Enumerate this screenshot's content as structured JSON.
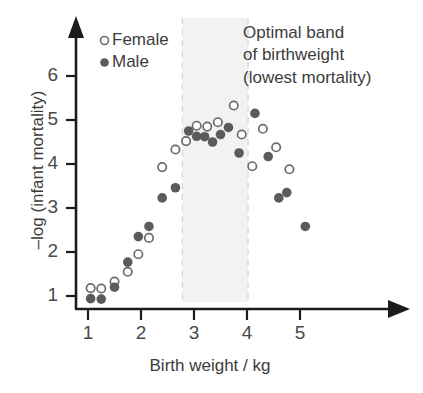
{
  "chart_data": {
    "type": "scatter",
    "title": "",
    "xlabel": "Birth weight / kg",
    "ylabel": "–log (infant mortality)",
    "xlim": [
      0.75,
      5.85
    ],
    "ylim": [
      0.55,
      6.6
    ],
    "xticks": [
      1,
      2,
      3,
      4,
      5
    ],
    "yticks": [
      1,
      2,
      3,
      4,
      5,
      6
    ],
    "xtick_labels": [
      "1",
      "2",
      "3",
      "4",
      "5"
    ],
    "ytick_labels": [
      "1",
      "2",
      "3",
      "4",
      "5",
      "6"
    ],
    "grid": false,
    "legend_position": "upper-left",
    "series": [
      {
        "name": "Female",
        "marker": "open-circle",
        "color": "#ffffff",
        "edge_color": "#6b6b6b",
        "points": [
          {
            "x": 1.05,
            "y": 1.18
          },
          {
            "x": 1.25,
            "y": 1.17
          },
          {
            "x": 1.5,
            "y": 1.33
          },
          {
            "x": 1.75,
            "y": 1.55
          },
          {
            "x": 1.95,
            "y": 1.95
          },
          {
            "x": 2.15,
            "y": 2.32
          },
          {
            "x": 2.4,
            "y": 3.93
          },
          {
            "x": 2.65,
            "y": 4.33
          },
          {
            "x": 2.85,
            "y": 4.52
          },
          {
            "x": 3.05,
            "y": 4.87
          },
          {
            "x": 3.25,
            "y": 4.85
          },
          {
            "x": 3.45,
            "y": 4.95
          },
          {
            "x": 3.75,
            "y": 5.33
          },
          {
            "x": 3.9,
            "y": 4.67
          },
          {
            "x": 4.1,
            "y": 3.95
          },
          {
            "x": 4.3,
            "y": 4.8
          },
          {
            "x": 4.55,
            "y": 4.38
          },
          {
            "x": 4.8,
            "y": 3.88
          }
        ]
      },
      {
        "name": "Male",
        "marker": "filled-circle",
        "color": "#5b5b5b",
        "edge_color": "#5b5b5b",
        "points": [
          {
            "x": 1.05,
            "y": 0.94
          },
          {
            "x": 1.25,
            "y": 0.93
          },
          {
            "x": 1.5,
            "y": 1.2
          },
          {
            "x": 1.75,
            "y": 1.77
          },
          {
            "x": 1.95,
            "y": 2.35
          },
          {
            "x": 2.15,
            "y": 2.58
          },
          {
            "x": 2.4,
            "y": 3.23
          },
          {
            "x": 2.65,
            "y": 3.46
          },
          {
            "x": 2.9,
            "y": 4.75
          },
          {
            "x": 3.05,
            "y": 4.63
          },
          {
            "x": 3.2,
            "y": 4.62
          },
          {
            "x": 3.35,
            "y": 4.5
          },
          {
            "x": 3.5,
            "y": 4.67
          },
          {
            "x": 3.65,
            "y": 4.83
          },
          {
            "x": 3.85,
            "y": 4.25
          },
          {
            "x": 4.15,
            "y": 5.15
          },
          {
            "x": 4.4,
            "y": 4.17
          },
          {
            "x": 4.6,
            "y": 3.23
          },
          {
            "x": 4.75,
            "y": 3.35
          },
          {
            "x": 5.1,
            "y": 2.58
          }
        ]
      }
    ],
    "shaded_band": {
      "label": "Optimal band of birthweight (lowest mortality)",
      "x_start": 2.78,
      "x_end": 4.02,
      "fill_color": "#f2f2f2",
      "border_color": "#d8d8d8",
      "border_style": "dashed"
    },
    "annotation": {
      "lines": [
        "Optimal band",
        "of birthweight",
        "(lowest mortality)"
      ]
    }
  },
  "legend": {
    "items": [
      {
        "label": "Female",
        "marker": "open-circle-icon"
      },
      {
        "label": "Male",
        "marker": "filled-circle-icon"
      }
    ]
  },
  "axes": {
    "x_title": "Birth weight / kg",
    "y_title": "–log (infant mortality)"
  },
  "style": {
    "axis_color": "#1c1c1c",
    "marker_fill": "#5b5b5b",
    "marker_stroke": "#6b6b6b",
    "band_fill": "#f2f2f2",
    "band_border": "#d8d8d8",
    "text_color": "#3c3c3c",
    "background": "#ffffff"
  }
}
